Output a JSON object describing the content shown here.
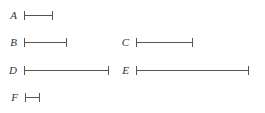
{
  "diagram": {
    "type": "line-segments",
    "unit_px": 14,
    "segments": [
      {
        "label": "A",
        "length_units": 2,
        "x": 24,
        "y": 11,
        "label_x": 9
      },
      {
        "label": "B",
        "length_units": 3,
        "x": 24,
        "y": 38,
        "label_x": 9
      },
      {
        "label": "C",
        "length_units": 4,
        "x": 136,
        "y": 38,
        "label_x": 121
      },
      {
        "label": "D",
        "length_units": 6,
        "x": 24,
        "y": 66,
        "label_x": 9
      },
      {
        "label": "E",
        "length_units": 8,
        "x": 136,
        "y": 66,
        "label_x": 121
      },
      {
        "label": "F",
        "length_units": 1,
        "x": 25,
        "y": 93,
        "label_x": 10
      }
    ],
    "line_color": "#555555",
    "label_color": "#333333"
  }
}
